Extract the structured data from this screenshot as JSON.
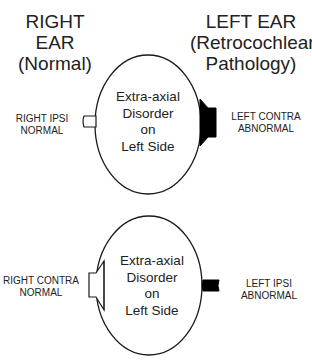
{
  "headings": {
    "right_ear": [
      "RIGHT",
      "EAR",
      "(Normal)"
    ],
    "left_ear": [
      "LEFT EAR",
      "(Retrocochlear",
      "Pathology)"
    ]
  },
  "top_panel": {
    "center_text": [
      "Extra-axial",
      "Disorder",
      "on",
      "Left Side"
    ],
    "left_label": [
      "RIGHT IPSI",
      "NORMAL"
    ],
    "right_label": [
      "LEFT CONTRA",
      "ABNORMAL"
    ],
    "left_probe": "open-rectangle",
    "right_probe": "filled-trapezoid"
  },
  "bottom_panel": {
    "center_text": [
      "Extra-axial",
      "Disorder",
      "on",
      "Left Side"
    ],
    "left_label": [
      "RIGHT CONTRA",
      "NORMAL"
    ],
    "right_label": [
      "LEFT IPSI",
      "ABNORMAL"
    ],
    "left_probe": "open-trapezoid",
    "right_probe": "filled-rectangle"
  },
  "colors": {
    "line": "#1a1a1a",
    "fill_abnormal": "#000000",
    "fill_normal": "#ffffff",
    "background": "#ffffff"
  }
}
